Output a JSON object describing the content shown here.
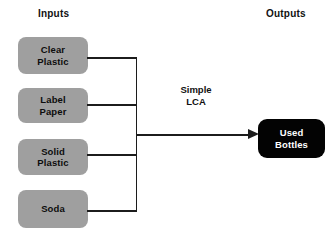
{
  "diagram": {
    "background_color": "#ffffff",
    "headings": {
      "inputs": "Inputs",
      "outputs": "Outputs"
    },
    "process": {
      "label": "Simple\nLCA"
    },
    "inputs": [
      {
        "id": "clear-plastic",
        "label": "Clear\nPlastic",
        "fill_color": "#9f9f9f",
        "text_color": "#0d0d0d"
      },
      {
        "id": "label-paper",
        "label": "Label\nPaper",
        "fill_color": "#9f9f9f",
        "text_color": "#0d0d0d"
      },
      {
        "id": "solid-plastic",
        "label": "Solid\nPlastic",
        "fill_color": "#9f9f9f",
        "text_color": "#0d0d0d"
      },
      {
        "id": "soda",
        "label": "Soda",
        "fill_color": "#9f9f9f",
        "text_color": "#0d0d0d"
      }
    ],
    "outputs": [
      {
        "id": "used-bottles",
        "label": "Used\nBottles",
        "fill_color": "#030303",
        "text_color": "#ffffff"
      }
    ],
    "connectors": {
      "line_color": "#1c1c1c",
      "arrow_direction": "right"
    }
  }
}
